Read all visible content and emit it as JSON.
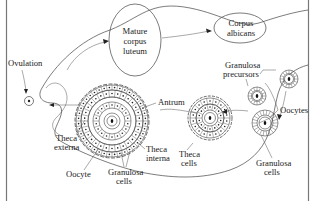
{
  "diagram": {
    "labels": {
      "mature_corpus_luteum": [
        "Mature",
        "corpus",
        "luteum"
      ],
      "corpus_albicans": [
        "Corpus",
        "albicans"
      ],
      "ovulation": "Ovulation",
      "granulosa_precursors": [
        "Granulosa",
        "precursors"
      ],
      "oocytes": "Oocytes",
      "antrum": "Antrum",
      "theca_externa": [
        "Theca",
        "externa"
      ],
      "theca_interna": [
        "Theca",
        "interna"
      ],
      "theca_cells": [
        "Theca",
        "cells"
      ],
      "oocyte": "Oocyte",
      "granulosa_cells_large": [
        "Granulosa",
        "cells"
      ],
      "granulosa_cells_small": [
        "Granulosa",
        "cells"
      ]
    },
    "stages": [
      "Granulosa precursors",
      "Primary follicle",
      "Secondary follicle",
      "Antral follicle",
      "Ovulation",
      "Mature corpus luteum",
      "Corpus albicans"
    ],
    "colors": {
      "stroke": "#444444",
      "text": "#1a1a1a",
      "background": "#ffffff"
    }
  }
}
